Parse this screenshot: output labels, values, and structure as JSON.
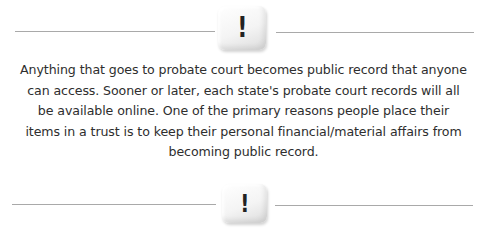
{
  "dividers": [
    {
      "icon": "exclamation-die-icon",
      "glyph": "!"
    },
    {
      "icon": "exclamation-die-icon",
      "glyph": "!"
    }
  ],
  "body": {
    "paragraph": "Anything that goes to probate court becomes public record that anyone can access. Sooner or later, each state's probate court records will all be available online. One of the primary reasons people place their items in a trust is to keep their personal financial/material affairs from becoming public record."
  },
  "colors": {
    "rule": "#a9a9a9",
    "text": "#2e2e2e",
    "background": "#ffffff"
  }
}
